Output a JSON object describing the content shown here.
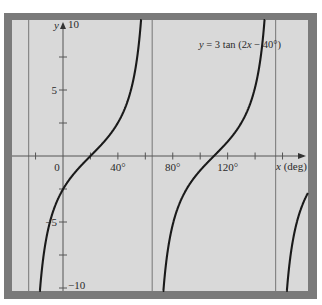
{
  "chart_data": {
    "type": "line",
    "title": "",
    "equation_label": {
      "var": "y",
      "rest": " = 3 tan (2",
      "var2": "x",
      "tail": " − 40°)"
    },
    "function": {
      "A": 3,
      "B": 2,
      "C": -40,
      "units": "degrees"
    },
    "xlabel": {
      "var": "x",
      "unit": " (deg)"
    },
    "ylabel": "y",
    "xlim": [
      -35,
      180
    ],
    "ylim": [
      -10,
      10
    ],
    "x_ticks": [
      -40,
      -20,
      0,
      20,
      40,
      60,
      80,
      100,
      120,
      140,
      160
    ],
    "x_tick_labels": [
      {
        "value": 0,
        "text": "0"
      },
      {
        "value": 40,
        "text": "40°"
      },
      {
        "value": 80,
        "text": "80°"
      },
      {
        "value": 120,
        "text": "120°"
      }
    ],
    "y_ticks": [
      -10,
      -7.5,
      -5,
      -2.5,
      2.5,
      5,
      7.5,
      10
    ],
    "y_tick_labels": [
      {
        "value": 10,
        "text": "10"
      },
      {
        "value": 5,
        "text": "5"
      },
      {
        "value": -5,
        "text": "−5"
      },
      {
        "value": -10,
        "text": "−10"
      }
    ],
    "asymptotes": [
      -25,
      65,
      155
    ],
    "zeros": [
      20,
      110
    ],
    "series": [
      {
        "name": "y = 3 tan(2x − 40°)",
        "branches": [
          [
            -25,
            65
          ],
          [
            65,
            155
          ],
          [
            155,
            245
          ]
        ]
      }
    ],
    "grid": false,
    "colors": {
      "frame": "#7a7a7a",
      "plot_bg": "#d9d9d9",
      "curve": "#1a1a1a",
      "axis": "#555555"
    }
  }
}
